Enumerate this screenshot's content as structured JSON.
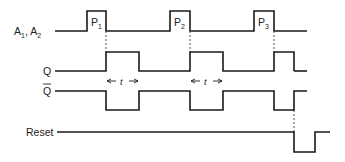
{
  "diagram": {
    "type": "timing-diagram",
    "signals": [
      {
        "id": "a",
        "label": "A",
        "label_sub": "1",
        "label_sep": ", ",
        "label2": "A",
        "label2_sub": "2"
      },
      {
        "id": "q",
        "label": "Q"
      },
      {
        "id": "qbar",
        "label": "Q",
        "overbar": true
      },
      {
        "id": "reset",
        "label": "Reset"
      }
    ],
    "pulses": [
      {
        "label": "P",
        "sub": "1"
      },
      {
        "label": "P",
        "sub": "2"
      },
      {
        "label": "P",
        "sub": "3"
      }
    ],
    "interval_label": "t",
    "colors": {
      "line": "#1a1a1a",
      "background": "#ffffff"
    }
  }
}
